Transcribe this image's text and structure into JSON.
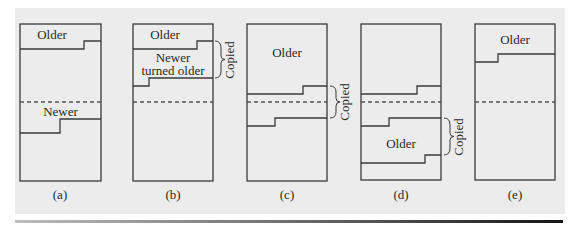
{
  "figure": {
    "panels": [
      {
        "id": "a",
        "caption": "(a)",
        "regions": [
          {
            "label": "Older"
          },
          {
            "label": "Newer"
          }
        ]
      },
      {
        "id": "b",
        "caption": "(b)",
        "regions": [
          {
            "label": "Older"
          },
          {
            "label_line1": "Newer",
            "label_line2": "turned older"
          }
        ],
        "brace_label": "Copied"
      },
      {
        "id": "c",
        "caption": "(c)",
        "regions": [
          {
            "label": "Older"
          }
        ],
        "brace_label": "Copied"
      },
      {
        "id": "d",
        "caption": "(d)",
        "regions": [
          {
            "label": "Older"
          }
        ],
        "brace_label": "Copied"
      },
      {
        "id": "e",
        "caption": "(e)",
        "regions": [
          {
            "label": "Older"
          }
        ]
      }
    ],
    "colors": {
      "background": "#ececec",
      "stroke": "#3a3a3a",
      "dashed": "#555555"
    }
  }
}
